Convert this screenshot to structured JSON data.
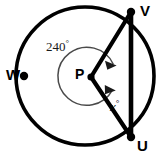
{
  "figure": {
    "type": "circle-geometry-diagram",
    "canvas": {
      "width": 162,
      "height": 153,
      "background": "#ffffff"
    },
    "colors": {
      "stroke": "#000000",
      "arc_marker": "#4a4a4a",
      "text": "#000000",
      "background": "#ffffff"
    },
    "circle": {
      "name": "main-circle",
      "center_x": 85,
      "center_y": 76,
      "radius": 69,
      "stroke_width": 3.6
    },
    "center_point": {
      "label": "P",
      "x": 91,
      "y": 77,
      "dot_radius": 3.6
    },
    "points": [
      {
        "id": "V",
        "label": "V",
        "x": 131,
        "y": 12,
        "dot_radius": 4.2
      },
      {
        "id": "U",
        "label": "U",
        "x": 131,
        "y": 137,
        "dot_radius": 4.2
      },
      {
        "id": "W",
        "label": "W",
        "x": 24,
        "y": 76,
        "dot_radius": 4.2
      }
    ],
    "segments": [
      {
        "id": "PV",
        "from": "P",
        "to": "V",
        "stroke_width": 4.2
      },
      {
        "id": "PU",
        "from": "P",
        "to": "U",
        "stroke_width": 4.2
      },
      {
        "id": "UV",
        "from": "U",
        "to": "V",
        "stroke_width": 4.6
      }
    ],
    "angles": {
      "reflex": {
        "label": "240",
        "degree_symbol": "°",
        "value": 240,
        "arc_radius": 29,
        "double_headed": true
      },
      "interior": {
        "label": "x",
        "degree_symbol": "°",
        "value": null
      }
    },
    "labels": {
      "V": "V",
      "U": "U",
      "W": "W",
      "P": "P",
      "reflex_angle": "240",
      "interior_angle": "x",
      "degree_symbol": "°"
    }
  }
}
